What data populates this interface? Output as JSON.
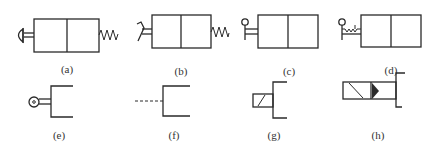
{
  "diagram": {
    "colors": {
      "stroke": "#2a2a2a",
      "label": "#333333",
      "background": "#ffffff"
    },
    "symbols": [
      {
        "id": "a",
        "label": "(a)",
        "actuator": "push-button",
        "return": "spring"
      },
      {
        "id": "b",
        "label": "(b)",
        "actuator": "pedal",
        "return": "spring"
      },
      {
        "id": "c",
        "label": "(c)",
        "actuator": "lever"
      },
      {
        "id": "d",
        "label": "(d)",
        "actuator": "lever-with-detent"
      },
      {
        "id": "e",
        "label": "(e)",
        "actuator": "roller"
      },
      {
        "id": "f",
        "label": "(f)",
        "actuator": "pilot-dashed-line"
      },
      {
        "id": "g",
        "label": "(g)",
        "actuator": "solenoid"
      },
      {
        "id": "h",
        "label": "(h)",
        "actuator": "solenoid-piloted"
      }
    ]
  }
}
